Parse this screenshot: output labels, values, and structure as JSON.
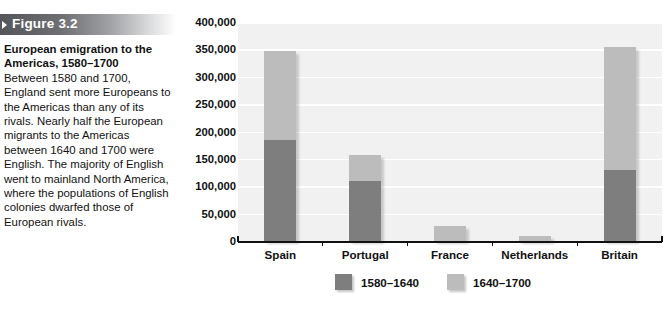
{
  "figure": {
    "banner_label": "Figure 3.2",
    "caption_title": "European emigration to the Americas, 1580–1700",
    "caption_text": "Between 1580 and 1700, England sent more Europeans to the Americas than any of its rivals. Nearly half the European migrants to the Americas between 1640 and 1700 were English. The majority of English went to mainland North America, where the populations of English colonies dwarfed those of European rivals."
  },
  "colors": {
    "early_period": "#7e7e7e",
    "late_period": "#bcbcbc",
    "plot_background": "#f1f1f1",
    "gridline": "#ffffff",
    "axis": "#111111",
    "banner_start": "#55565a",
    "banner_end": "#ffffff"
  },
  "chart_data": {
    "type": "bar",
    "stacked": true,
    "title": "European emigration to the Americas, 1580–1700",
    "xlabel": "",
    "ylabel": "",
    "categories": [
      "Spain",
      "Portugal",
      "France",
      "Netherlands",
      "Britain"
    ],
    "series": [
      {
        "name": "1580–1640",
        "color": "#7e7e7e",
        "values": [
          185000,
          110000,
          0,
          0,
          130000
        ]
      },
      {
        "name": "1640–1700",
        "color": "#bcbcbc",
        "values": [
          162000,
          47000,
          27000,
          9000,
          225000
        ]
      }
    ],
    "totals": [
      347000,
      157000,
      27000,
      9000,
      355000
    ],
    "ylim": [
      0,
      400000
    ],
    "yticks": [
      0,
      50000,
      100000,
      150000,
      200000,
      250000,
      300000,
      350000,
      400000
    ],
    "ytick_labels": [
      "0",
      "50,000",
      "100,000",
      "150,000",
      "200,000",
      "250,000",
      "300,000",
      "350,000",
      "400,000"
    ],
    "grid": true,
    "legend_position": "bottom-center",
    "legend_entries": [
      "1580–1640",
      "1640–1700"
    ]
  }
}
